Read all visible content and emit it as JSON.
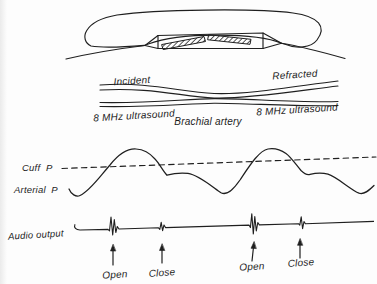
{
  "colors": {
    "ink": "#1f1f1f",
    "paper": "#fdfdfd"
  },
  "upper_diagram": {
    "incident_line1": "Incident",
    "incident_line2": "8 MHz ultrasound",
    "refracted_line1": "Refracted",
    "refracted_line2": "8 MHz ultrasound",
    "artery_label": "Brachial artery"
  },
  "traces": {
    "cuff_pressure_label": "Cuff  P",
    "arterial_pressure_label": "Arterial  P",
    "audio_output_label": "Audio output"
  },
  "events": [
    {
      "label": "Open"
    },
    {
      "label": "Close"
    },
    {
      "label": "Open"
    },
    {
      "label": "Close"
    }
  ]
}
